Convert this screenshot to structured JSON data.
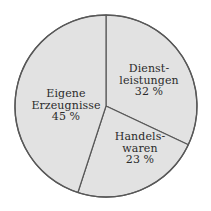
{
  "chart_data": {
    "type": "pie",
    "title": "",
    "subtitle": "",
    "xlabel": "",
    "ylabel": "",
    "legend_position": "none",
    "grid": false,
    "unit": "%",
    "start_angle_deg": 0,
    "direction": "clockwise",
    "categories": [
      "Dienstleistungen",
      "Handelswaren",
      "Eigene Erzeugnisse"
    ],
    "values": [
      32,
      23,
      45
    ],
    "slices": [
      {
        "name": "Dienstleistungen",
        "value": 32,
        "value_text": "32 %",
        "label_lines": [
          "Dienst-",
          "leistungen"
        ],
        "fill": "#e2e2e2",
        "stroke": "#585858"
      },
      {
        "name": "Handelswaren",
        "value": 23,
        "value_text": "23 %",
        "label_lines": [
          "Handels-",
          "waren"
        ],
        "fill": "#e2e2e2",
        "stroke": "#585858"
      },
      {
        "name": "Eigene Erzeugnisse",
        "value": 45,
        "value_text": "45 %",
        "label_lines": [
          "Eigene",
          "Erzeugnisse"
        ],
        "fill": "#e2e2e2",
        "stroke": "#585858"
      }
    ]
  },
  "colors": {
    "background": "#ffffff",
    "slice_fill": "#e2e2e2",
    "outline": "#585858",
    "text": "#2b2b2b"
  },
  "geometry": {
    "center_x": 106,
    "center_y": 106,
    "radius": 91
  }
}
